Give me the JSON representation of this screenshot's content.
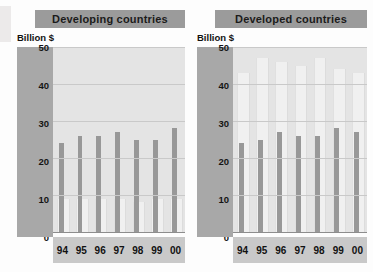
{
  "chart_data": [
    {
      "type": "bar",
      "title": "Developing countries",
      "ylabel": "Billion $",
      "xlabel": "",
      "categories": [
        "94",
        "95",
        "96",
        "97",
        "98",
        "99",
        "00"
      ],
      "yticks": [
        0,
        10,
        20,
        30,
        40,
        50
      ],
      "ylim": [
        0,
        50
      ],
      "grid": true,
      "legend": "none",
      "series": [
        {
          "name": "light-series",
          "color": "#f0f0f0",
          "values": [
            9,
            9,
            9,
            9,
            8,
            9,
            9
          ]
        },
        {
          "name": "dark-series",
          "color": "#989898",
          "values": [
            24,
            26,
            26,
            27,
            25,
            25,
            28
          ]
        }
      ]
    },
    {
      "type": "bar",
      "title": "Developed countries",
      "ylabel": "Billion $",
      "xlabel": "",
      "categories": [
        "94",
        "95",
        "96",
        "97",
        "98",
        "99",
        "00"
      ],
      "yticks": [
        0,
        10,
        20,
        30,
        40,
        50
      ],
      "ylim": [
        0,
        50
      ],
      "grid": true,
      "legend": "none",
      "series": [
        {
          "name": "light-series",
          "color": "#f0f0f0",
          "values": [
            43,
            47,
            46,
            45,
            47,
            44,
            43
          ]
        },
        {
          "name": "dark-series",
          "color": "#989898",
          "values": [
            24,
            25,
            27,
            26,
            26,
            28,
            27
          ]
        }
      ]
    }
  ],
  "panels": [
    {
      "id": "developing",
      "title": "Developing countries",
      "axis_caption": "Billion $"
    },
    {
      "id": "developed",
      "title": "Developed countries",
      "axis_caption": "Billion $"
    }
  ],
  "colors": {
    "banner": "#9b9b9b",
    "axis_strip": "#a8a8a8",
    "plot_background": "#e4e4e4",
    "xaxis_band": "#c9c9c9",
    "bar_dark": "#989898",
    "bar_light": "#f0f0f0",
    "gridline": "#c9c9c9",
    "text": "#111111"
  }
}
